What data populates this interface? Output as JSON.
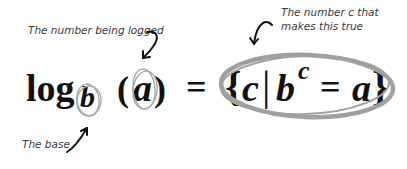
{
  "annotations": {
    "logged": "The number being logged",
    "c_line1": "The number c that",
    "c_line2": "makes this true",
    "base": "The base"
  },
  "formula": {
    "log": "log",
    "base": "b",
    "open_paren": "(",
    "arg": "a",
    "close_paren": ")",
    "equals": "=",
    "open_brace": "{",
    "c": "c",
    "bar": "|",
    "b": "b",
    "exponent": "c",
    "equals2": "=",
    "a": "a",
    "close_brace": "}"
  },
  "colors": {
    "ink": "#111111",
    "circle": "#a8a8a8",
    "arrow": "#111111",
    "label": "#3a3a3a"
  }
}
